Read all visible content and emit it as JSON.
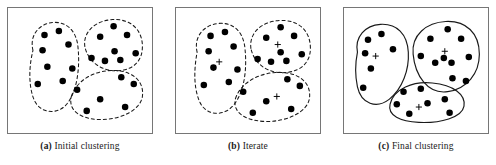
{
  "figure": {
    "background_color": "#ffffff",
    "frame_color": "#767676",
    "point_color": "#000000",
    "boundary_color": "#1a1a1a",
    "centroid_color": "#000000"
  },
  "panels": [
    {
      "id": "a",
      "label": "(a)",
      "caption": "Initial clustering",
      "caption_full": "(a) Initial clustering",
      "boundary_style": "dashed",
      "show_centroids": false,
      "clusters": [
        {
          "name": "cluster-left",
          "outline": "M 26 44 C 22 28, 33 16, 47 15 C 62 14, 72 25, 73 42 C 75 62, 72 86, 62 99 C 52 112, 33 110, 27 95 C 21 80, 22 60, 26 44 Z",
          "points": [
            {
              "x": 38,
              "y": 28
            },
            {
              "x": 53,
              "y": 24
            },
            {
              "x": 63,
              "y": 38
            },
            {
              "x": 36,
              "y": 44
            },
            {
              "x": 41,
              "y": 61
            },
            {
              "x": 31,
              "y": 79
            },
            {
              "x": 57,
              "y": 76
            },
            {
              "x": 67,
              "y": 63
            }
          ]
        },
        {
          "name": "cluster-top-right",
          "outline": "M 80 40 C 78 24, 92 13, 109 12 C 127 11, 140 22, 140 40 C 140 54, 132 63, 118 65 C 100 67, 84 58, 80 40 Z",
          "points": [
            {
              "x": 110,
              "y": 19
            },
            {
              "x": 96,
              "y": 30
            },
            {
              "x": 124,
              "y": 28
            },
            {
              "x": 111,
              "y": 45
            },
            {
              "x": 87,
              "y": 52
            },
            {
              "x": 101,
              "y": 55
            },
            {
              "x": 117,
              "y": 54
            },
            {
              "x": 133,
              "y": 47
            }
          ]
        },
        {
          "name": "cluster-bottom-right",
          "outline": "M 66 92 C 72 74, 92 64, 112 65 C 132 66, 142 78, 140 92 C 138 106, 118 116, 97 116 C 78 116, 62 108, 66 92 Z",
          "points": [
            {
              "x": 118,
              "y": 72
            },
            {
              "x": 131,
              "y": 79
            },
            {
              "x": 72,
              "y": 85
            },
            {
              "x": 96,
              "y": 95
            },
            {
              "x": 82,
              "y": 107
            },
            {
              "x": 122,
              "y": 103
            }
          ]
        }
      ]
    },
    {
      "id": "b",
      "label": "(b)",
      "caption": "Iterate",
      "caption_full": "(b) Iterate",
      "boundary_style": "dashed",
      "show_centroids": true,
      "clusters": [
        {
          "name": "cluster-left",
          "outline": "M 22 46 C 18 29, 30 17, 45 16 C 61 15, 71 26, 72 44 C 74 64, 71 88, 60 101 C 49 114, 30 112, 24 96 C 18 81, 19 62, 22 46 Z",
          "points": [
            {
              "x": 36,
              "y": 29
            },
            {
              "x": 51,
              "y": 25
            },
            {
              "x": 60,
              "y": 40
            },
            {
              "x": 34,
              "y": 45
            },
            {
              "x": 39,
              "y": 62
            },
            {
              "x": 29,
              "y": 80
            },
            {
              "x": 55,
              "y": 77
            },
            {
              "x": 64,
              "y": 64
            }
          ],
          "centroid": {
            "x": 45,
            "y": 56
          }
        },
        {
          "name": "cluster-top-right",
          "outline": "M 78 42 C 76 25, 90 14, 108 13 C 127 12, 140 23, 140 42 C 140 56, 131 65, 116 67 C 98 69, 82 60, 78 42 Z",
          "points": [
            {
              "x": 109,
              "y": 20
            },
            {
              "x": 94,
              "y": 31
            },
            {
              "x": 123,
              "y": 29
            },
            {
              "x": 109,
              "y": 46
            },
            {
              "x": 85,
              "y": 53
            },
            {
              "x": 99,
              "y": 56
            },
            {
              "x": 115,
              "y": 55
            },
            {
              "x": 131,
              "y": 48
            }
          ],
          "centroid": {
            "x": 106,
            "y": 38
          }
        },
        {
          "name": "cluster-bottom-right",
          "outline": "M 62 94 C 68 76, 90 66, 110 67 C 131 68, 141 80, 139 94 C 137 108, 116 118, 95 118 C 75 118, 58 110, 62 94 Z",
          "points": [
            {
              "x": 116,
              "y": 74
            },
            {
              "x": 129,
              "y": 81
            },
            {
              "x": 70,
              "y": 87
            },
            {
              "x": 94,
              "y": 97
            },
            {
              "x": 80,
              "y": 109
            },
            {
              "x": 120,
              "y": 105
            }
          ],
          "centroid": {
            "x": 105,
            "y": 92
          }
        }
      ]
    },
    {
      "id": "c",
      "label": "(c)",
      "caption": "Final clustering",
      "caption_full": "(c) Final clustering",
      "boundary_style": "solid",
      "show_centroids": true,
      "clusters": [
        {
          "name": "cluster-left",
          "outline": "M 14 46 C 11 30, 22 18, 38 17 C 55 16, 66 27, 67 46 C 68 64, 61 84, 47 95 C 34 105, 18 100, 14 82 C 11 68, 12 56, 14 46 Z",
          "points": [
            {
              "x": 25,
              "y": 33
            },
            {
              "x": 39,
              "y": 27
            },
            {
              "x": 51,
              "y": 43
            },
            {
              "x": 22,
              "y": 47
            },
            {
              "x": 28,
              "y": 63
            },
            {
              "x": 20,
              "y": 83
            }
          ],
          "centroid": {
            "x": 33,
            "y": 50
          }
        },
        {
          "name": "cluster-right",
          "outline": "M 72 48 C 70 28, 86 15, 106 14 C 127 13, 141 26, 141 48 C 141 68, 128 84, 108 87 C 87 90, 74 70, 72 48 Z",
          "points": [
            {
              "x": 108,
              "y": 22
            },
            {
              "x": 90,
              "y": 32
            },
            {
              "x": 122,
              "y": 32
            },
            {
              "x": 80,
              "y": 50
            },
            {
              "x": 104,
              "y": 52
            },
            {
              "x": 130,
              "y": 51
            },
            {
              "x": 95,
              "y": 57
            },
            {
              "x": 112,
              "y": 57
            },
            {
              "x": 113,
              "y": 73
            },
            {
              "x": 127,
              "y": 76
            }
          ],
          "centroid": {
            "x": 105,
            "y": 45
          }
        },
        {
          "name": "cluster-bottom",
          "outline": "M 48 100 C 52 84, 72 76, 92 78 C 114 80, 127 90, 125 102 C 123 114, 100 120, 78 119 C 59 118, 45 112, 48 100 Z",
          "points": [
            {
              "x": 62,
              "y": 87
            },
            {
              "x": 80,
              "y": 84
            },
            {
              "x": 55,
              "y": 100
            },
            {
              "x": 87,
              "y": 99
            },
            {
              "x": 105,
              "y": 95
            },
            {
              "x": 68,
              "y": 110
            },
            {
              "x": 110,
              "y": 109
            }
          ],
          "centroid": {
            "x": 78,
            "y": 103
          }
        }
      ]
    }
  ]
}
